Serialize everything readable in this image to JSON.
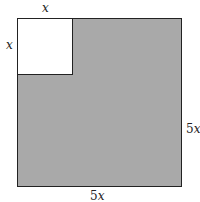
{
  "diagram": {
    "outer_square": {
      "width_label_num": "5",
      "width_label_var": "x",
      "height_label_num": "5",
      "height_label_var": "x",
      "fill": "#a9a9a9"
    },
    "inner_square": {
      "top_label": "x",
      "left_label": "x",
      "fill": "#ffffff"
    }
  }
}
